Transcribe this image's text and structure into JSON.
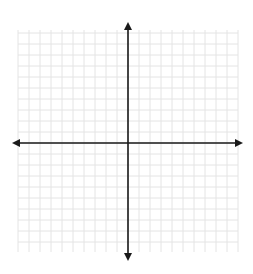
{
  "diagram": {
    "type": "coordinate-plane",
    "grid": {
      "x_start": 18,
      "x_end": 238,
      "y_start": 30,
      "y_end": 252,
      "spacing": 11,
      "line_color": "#e4e4e4"
    },
    "axes": {
      "origin_x": 128,
      "origin_y": 143,
      "x_axis_left": 12,
      "x_axis_right": 243,
      "y_axis_top": 22,
      "y_axis_bottom": 261,
      "color": "#1a1a1a",
      "arrowheads": [
        "left",
        "right",
        "up",
        "down"
      ]
    },
    "labels": []
  }
}
